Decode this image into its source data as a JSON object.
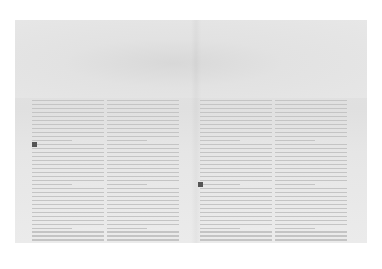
{
  "document": {
    "type": "scanned magazine spread",
    "legibility": "text too faint to read",
    "left_page": {
      "columns": 2,
      "drop_cap": "B",
      "text": ""
    },
    "right_page": {
      "columns": 2,
      "drop_cap": "T",
      "text": ""
    },
    "colors": {
      "paper": "#e4e4e4",
      "text": "#c4c4c4",
      "drop_cap": "#555555"
    }
  }
}
